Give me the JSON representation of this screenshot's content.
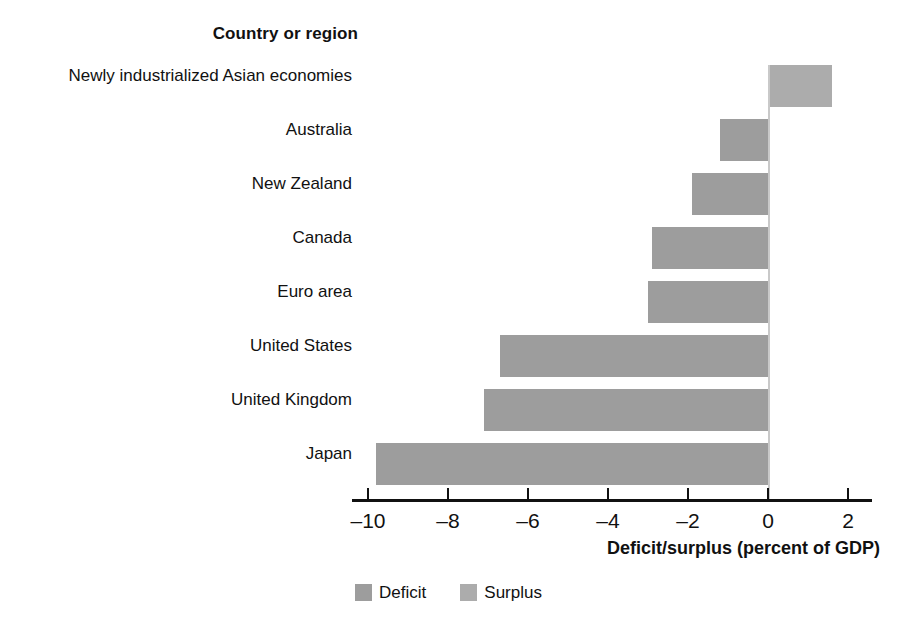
{
  "chart_data": {
    "type": "bar",
    "orientation": "horizontal",
    "title": "Country or region",
    "xlabel": "Deficit/surplus (percent of GDP)",
    "ylabel": "Country or region",
    "xlim": [
      -10,
      2
    ],
    "xticks": [
      -10,
      -8,
      -6,
      -4,
      -2,
      0,
      2
    ],
    "xticklabels": [
      "–10",
      "–8",
      "–6",
      "–4",
      "–2",
      "0",
      "2"
    ],
    "grid": false,
    "legend_position": "bottom-center",
    "categories": [
      "Newly industrialized Asian economies",
      "Australia",
      "New Zealand",
      "Canada",
      "Euro area",
      "United States",
      "United Kingdom",
      "Japan"
    ],
    "values": [
      1.6,
      -1.2,
      -1.9,
      -2.9,
      -3.0,
      -6.7,
      -7.1,
      -9.8
    ],
    "series": [
      {
        "name": "Deficit",
        "color": "#9d9d9d"
      },
      {
        "name": "Surplus",
        "color": "#acacac"
      }
    ],
    "legend": [
      {
        "label": "Deficit",
        "color": "#9d9d9d"
      },
      {
        "label": "Surplus",
        "color": "#acacac"
      }
    ]
  },
  "heading": {
    "text": "Country or region"
  },
  "axis": {
    "title": "Deficit/surplus (percent of GDP)",
    "tick_labels": [
      "–10",
      "–8",
      "–6",
      "–4",
      "–2",
      "0",
      "2"
    ]
  },
  "legend": {
    "items": [
      {
        "label": "Deficit",
        "color": "#9d9d9d"
      },
      {
        "label": "Surplus",
        "color": "#acacac"
      }
    ]
  }
}
